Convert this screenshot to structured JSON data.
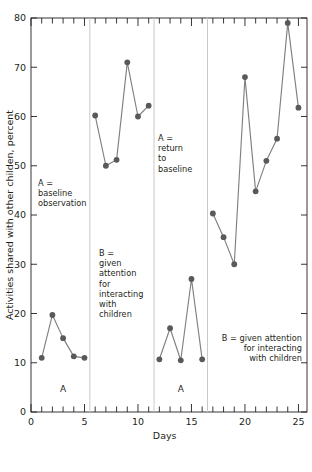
{
  "chart_data": {
    "type": "line",
    "title": "",
    "xlabel": "Days",
    "ylabel": "Activities shared with other childen, percent",
    "xlim": [
      0,
      25.8
    ],
    "ylim": [
      0,
      80
    ],
    "x_ticks_major": [
      0,
      5,
      10,
      15,
      20,
      25
    ],
    "x_tick_labels": [
      "0",
      "5",
      "10",
      "15",
      "20",
      "25"
    ],
    "x_minor_tick_step": 1,
    "y_ticks_major": [
      0,
      10,
      20,
      30,
      40,
      50,
      60,
      70,
      80
    ],
    "y_tick_labels": [
      "0",
      "10",
      "20",
      "30",
      "40",
      "50",
      "60",
      "70",
      "80"
    ],
    "grid": false,
    "legend": "none",
    "marker": "filled-circle",
    "marker_color": "#59595b",
    "line_color": "#808083",
    "series": [
      {
        "name": "Activities shared with other children",
        "x": [
          1,
          2,
          3,
          4,
          5,
          6,
          7,
          8,
          9,
          10,
          11,
          12,
          13,
          14,
          15,
          16,
          17,
          18,
          19,
          20,
          21,
          22,
          23,
          24,
          25
        ],
        "values": [
          11.0,
          19.7,
          15.0,
          11.3,
          11.0,
          60.2,
          50.0,
          51.2,
          71.0,
          60.0,
          62.2,
          10.7,
          17.0,
          10.5,
          27.0,
          10.7,
          40.3,
          35.5,
          30.0,
          68.0,
          44.8,
          51.0,
          55.5,
          79.0,
          61.8
        ]
      }
    ],
    "phase_dividers": [
      5.5,
      11.5,
      16.5
    ],
    "phases": [
      {
        "letter": "A",
        "x_center": 3.0,
        "letter_y": 4.0,
        "segment_x": [
          1,
          5
        ]
      },
      {
        "letter": "B",
        "x_center": 8.5,
        "letter_y": 4.0,
        "segment_x": [
          6,
          11
        ],
        "letter_hidden": true
      },
      {
        "letter": "A",
        "x_center": 14.0,
        "letter_y": 4.0,
        "segment_x": [
          12,
          16
        ]
      },
      {
        "letter": "B",
        "x_center": 21.0,
        "letter_y": 4.0,
        "segment_x": [
          17,
          25
        ],
        "letter_hidden": true
      }
    ],
    "annotations": [
      {
        "id": "anno-a-baseline",
        "lines": [
          "A =",
          "baseline",
          "observation"
        ],
        "align": "left",
        "x_px": 38,
        "y_px": 186
      },
      {
        "id": "anno-b-given-attention",
        "lines": [
          "B =",
          "given",
          "attention",
          "for",
          "interacting",
          "with",
          "children"
        ],
        "align": "left",
        "x_px": 99,
        "y_px": 256
      },
      {
        "id": "anno-a-return",
        "lines": [
          "A =",
          "return",
          "to",
          "baseline"
        ],
        "align": "left",
        "x_px": 158,
        "y_px": 141
      },
      {
        "id": "anno-b-given-attention-2",
        "lines": [
          "B = given attention",
          "for interacting",
          "with children"
        ],
        "align": "right",
        "x_px": 302,
        "y_px": 341
      }
    ]
  },
  "colors": {
    "axis": "#231f20",
    "divider": "#c9c9cc",
    "marker": "#59595b",
    "line": "#808083",
    "text": "#231f20",
    "background": "#ffffff"
  }
}
